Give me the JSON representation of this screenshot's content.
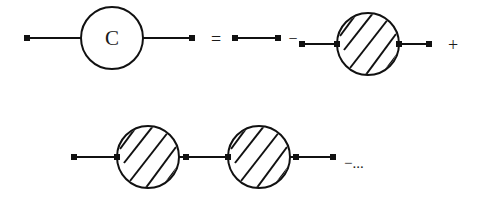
{
  "diagram": {
    "type": "dyson-equation-diagram",
    "row1": {
      "full_propagator_label": "C",
      "equals": "=",
      "minus": "−",
      "plus": "+"
    },
    "row2": {
      "trailing": "−..."
    },
    "colors": {
      "stroke": "#111111",
      "background": "#ffffff"
    }
  }
}
